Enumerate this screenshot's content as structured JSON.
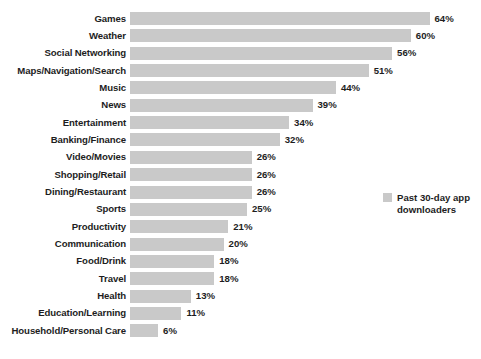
{
  "chart_data": {
    "type": "bar",
    "orientation": "horizontal",
    "title": "",
    "subtitle": "",
    "xlabel": "",
    "ylabel": "",
    "xlim": [
      0,
      64
    ],
    "grid": false,
    "legend_position": "right",
    "bar_color": "#c9c9c9",
    "text_color": "#1d1d1d",
    "background": "#ffffff",
    "value_suffix": "%",
    "categories": [
      "Games",
      "Weather",
      "Social Networking",
      "Maps/Navigation/Search",
      "Music",
      "News",
      "Entertainment",
      "Banking/Finance",
      "Video/Movies",
      "Shopping/Retail",
      "Dining/Restaurant",
      "Sports",
      "Productivity",
      "Communication",
      "Food/Drink",
      "Travel",
      "Health",
      "Education/Learning",
      "Household/Personal Care"
    ],
    "values": [
      64,
      60,
      56,
      51,
      44,
      39,
      34,
      32,
      26,
      26,
      26,
      25,
      21,
      20,
      18,
      18,
      13,
      11,
      6
    ],
    "value_labels": [
      "64%",
      "60%",
      "56%",
      "51%",
      "44%",
      "39%",
      "34%",
      "32%",
      "26%",
      "26%",
      "26%",
      "25%",
      "21%",
      "20%",
      "18%",
      "18%",
      "13%",
      "11%",
      "6%"
    ],
    "series": [
      {
        "name": "Past 30-day app downloaders",
        "values": [
          64,
          60,
          56,
          51,
          44,
          39,
          34,
          32,
          26,
          26,
          26,
          25,
          21,
          20,
          18,
          18,
          13,
          11,
          6
        ]
      }
    ],
    "legend": [
      "Past 30-day app downloaders"
    ]
  },
  "legend": {
    "label": "Past 30-day app downloaders",
    "swatch_color": "#c9c9c9",
    "swatch_icon": "legend-swatch-icon"
  }
}
